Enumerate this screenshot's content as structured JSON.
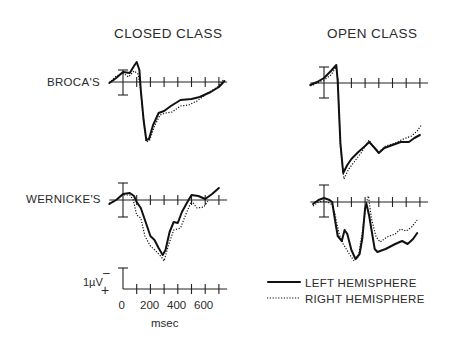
{
  "chart_data": {
    "type": "line",
    "title": "",
    "columns": [
      "CLOSED CLASS",
      "OPEN CLASS"
    ],
    "rows": [
      "BROCA'S",
      "WERNICKE'S"
    ],
    "xlabel": "msec",
    "x_ticks": [
      0,
      200,
      400,
      600
    ],
    "x_tick_interval_ms": 100,
    "xlim": [
      -100,
      750
    ],
    "scale_bar": {
      "label": "1µV",
      "minus_sign": "−",
      "plus_sign": "+",
      "value_uV": 1,
      "polarity": "negative up"
    },
    "legend": [
      {
        "name": "LEFT HEMISPHERE",
        "style": "solid"
      },
      {
        "name": "RIGHT HEMISPHERE",
        "style": "dotted"
      }
    ],
    "grid": false,
    "panels": [
      {
        "id": "broca-closed",
        "row": "BROCA'S",
        "column": "CLOSED CLASS",
        "x0": 123,
        "baseline": 82,
        "err_top": 70,
        "err_bot": 95,
        "series": [
          {
            "name": "LEFT HEMISPHERE",
            "points": [
              [
                -100,
                0.05
              ],
              [
                -50,
                -0.2
              ],
              [
                0,
                -0.5
              ],
              [
                50,
                -0.45
              ],
              [
                80,
                -0.8
              ],
              [
                100,
                -1.0
              ],
              [
                120,
                -0.6
              ],
              [
                130,
                0.4
              ],
              [
                150,
                1.9
              ],
              [
                170,
                2.9
              ],
              [
                190,
                2.85
              ],
              [
                220,
                2.15
              ],
              [
                260,
                1.55
              ],
              [
                300,
                1.45
              ],
              [
                350,
                1.2
              ],
              [
                420,
                0.9
              ],
              [
                500,
                0.85
              ],
              [
                560,
                0.75
              ],
              [
                640,
                0.5
              ],
              [
                700,
                0.25
              ],
              [
                740,
                -0.05
              ]
            ]
          },
          {
            "name": "RIGHT HEMISPHERE",
            "points": [
              [
                -100,
                0.05
              ],
              [
                -50,
                -0.3
              ],
              [
                0,
                -0.45
              ],
              [
                40,
                -0.25
              ],
              [
                80,
                -0.55
              ],
              [
                110,
                -0.4
              ],
              [
                125,
                0.2
              ],
              [
                145,
                1.6
              ],
              [
                170,
                3.0
              ],
              [
                195,
                2.9
              ],
              [
                230,
                2.2
              ],
              [
                270,
                1.65
              ],
              [
                310,
                1.55
              ],
              [
                360,
                1.5
              ],
              [
                420,
                1.2
              ],
              [
                480,
                1.15
              ],
              [
                540,
                0.95
              ],
              [
                620,
                0.55
              ],
              [
                690,
                0.25
              ],
              [
                730,
                -0.1
              ]
            ]
          }
        ]
      },
      {
        "id": "broca-open",
        "row": "BROCA'S",
        "column": "OPEN CLASS",
        "x0": 324,
        "baseline": 83,
        "err_top": 67,
        "err_bot": 98,
        "series": [
          {
            "name": "LEFT HEMISPHERE",
            "points": [
              [
                -100,
                0.1
              ],
              [
                -50,
                -0.05
              ],
              [
                0,
                -0.25
              ],
              [
                50,
                -0.6
              ],
              [
                90,
                -0.9
              ],
              [
                100,
                -0.1
              ],
              [
                120,
                3.0
              ],
              [
                140,
                4.5
              ],
              [
                170,
                4.1
              ],
              [
                200,
                3.8
              ],
              [
                250,
                3.45
              ],
              [
                300,
                3.15
              ],
              [
                330,
                2.95
              ],
              [
                370,
                3.25
              ],
              [
                400,
                3.5
              ],
              [
                440,
                3.25
              ],
              [
                500,
                3.1
              ],
              [
                560,
                2.95
              ],
              [
                620,
                2.95
              ],
              [
                660,
                2.75
              ],
              [
                700,
                2.6
              ]
            ]
          },
          {
            "name": "RIGHT HEMISPHERE",
            "points": [
              [
                -100,
                0.15
              ],
              [
                -50,
                0.0
              ],
              [
                0,
                -0.15
              ],
              [
                50,
                -0.4
              ],
              [
                90,
                -0.8
              ],
              [
                100,
                -0.2
              ],
              [
                120,
                3.2
              ],
              [
                145,
                4.8
              ],
              [
                180,
                4.3
              ],
              [
                220,
                3.95
              ],
              [
                270,
                3.5
              ],
              [
                330,
                2.85
              ],
              [
                360,
                3.2
              ],
              [
                400,
                3.45
              ],
              [
                450,
                3.15
              ],
              [
                520,
                3.0
              ],
              [
                580,
                2.8
              ],
              [
                640,
                2.65
              ],
              [
                680,
                2.4
              ],
              [
                710,
                2.1
              ]
            ]
          }
        ]
      },
      {
        "id": "wernicke-closed",
        "row": "WERNICKE'S",
        "column": "CLOSED CLASS",
        "x0": 123,
        "baseline": 200,
        "err_top": 183,
        "err_bot": 217,
        "series": [
          {
            "name": "LEFT HEMISPHERE",
            "points": [
              [
                -100,
                0.2
              ],
              [
                -50,
                0.0
              ],
              [
                0,
                -0.3
              ],
              [
                50,
                -0.35
              ],
              [
                80,
                -0.2
              ],
              [
                100,
                0.1
              ],
              [
                130,
                0.4
              ],
              [
                170,
                1.2
              ],
              [
                200,
                1.8
              ],
              [
                230,
                2.0
              ],
              [
                260,
                2.4
              ],
              [
                290,
                2.75
              ],
              [
                310,
                2.5
              ],
              [
                340,
                1.6
              ],
              [
                370,
                1.1
              ],
              [
                400,
                1.15
              ],
              [
                430,
                0.6
              ],
              [
                470,
                0.1
              ],
              [
                500,
                -0.25
              ],
              [
                550,
                -0.2
              ],
              [
                600,
                -0.05
              ],
              [
                650,
                -0.3
              ],
              [
                700,
                -0.6
              ]
            ]
          },
          {
            "name": "RIGHT HEMISPHERE",
            "points": [
              [
                -100,
                0.15
              ],
              [
                -50,
                0.0
              ],
              [
                0,
                -0.25
              ],
              [
                50,
                -0.25
              ],
              [
                75,
                0.0
              ],
              [
                100,
                0.75
              ],
              [
                130,
                0.9
              ],
              [
                160,
                1.8
              ],
              [
                200,
                2.3
              ],
              [
                240,
                2.55
              ],
              [
                280,
                2.85
              ],
              [
                300,
                3.05
              ],
              [
                330,
                2.3
              ],
              [
                370,
                1.5
              ],
              [
                420,
                1.4
              ],
              [
                460,
                0.7
              ],
              [
                500,
                0.05
              ],
              [
                540,
                0.4
              ],
              [
                590,
                0.35
              ],
              [
                620,
                0.05
              ]
            ]
          }
        ]
      },
      {
        "id": "wernicke-open",
        "row": "WERNICKE'S",
        "column": "OPEN CLASS",
        "x0": 324,
        "baseline": 202,
        "err_top": 185,
        "err_bot": 217,
        "series": [
          {
            "name": "LEFT HEMISPHERE",
            "points": [
              [
                -80,
                0.1
              ],
              [
                -40,
                -0.1
              ],
              [
                0,
                -0.2
              ],
              [
                40,
                -0.1
              ],
              [
                60,
                0.0
              ],
              [
                80,
                0.9
              ],
              [
                100,
                1.7
              ],
              [
                130,
                1.95
              ],
              [
                150,
                1.4
              ],
              [
                170,
                1.6
              ],
              [
                200,
                2.4
              ],
              [
                230,
                2.85
              ],
              [
                260,
                2.6
              ],
              [
                280,
                1.8
              ],
              [
                300,
                0.3
              ],
              [
                310,
                0.1
              ],
              [
                330,
                0.7
              ],
              [
                370,
                2.35
              ],
              [
                390,
                2.5
              ],
              [
                450,
                2.35
              ],
              [
                520,
                2.1
              ],
              [
                570,
                1.95
              ],
              [
                610,
                2.1
              ],
              [
                650,
                1.85
              ],
              [
                680,
                1.55
              ]
            ]
          },
          {
            "name": "RIGHT HEMISPHERE",
            "points": [
              [
                -80,
                0.2
              ],
              [
                -40,
                0.0
              ],
              [
                0,
                -0.05
              ],
              [
                40,
                0.05
              ],
              [
                60,
                0.15
              ],
              [
                80,
                0.6
              ],
              [
                110,
                1.6
              ],
              [
                140,
                2.1
              ],
              [
                180,
                2.55
              ],
              [
                220,
                2.95
              ],
              [
                250,
                2.75
              ],
              [
                280,
                1.5
              ],
              [
                310,
                0.0
              ],
              [
                325,
                -0.3
              ],
              [
                345,
                0.8
              ],
              [
                380,
                1.75
              ],
              [
                410,
                2.0
              ],
              [
                460,
                1.75
              ],
              [
                520,
                1.6
              ],
              [
                560,
                1.35
              ],
              [
                600,
                1.45
              ],
              [
                640,
                1.25
              ],
              [
                680,
                0.9
              ]
            ]
          }
        ]
      }
    ],
    "scale_axis": {
      "x0": 123,
      "baseline": 289,
      "bar_top": 268
    }
  },
  "labels": {
    "col_closed": "CLOSED CLASS",
    "col_open": "OPEN CLASS",
    "row_broca": "BROCA'S",
    "row_wernicke": "WERNICKE'S",
    "scale_uv": "1µV",
    "scale_minus": "–",
    "scale_plus": "+",
    "tick_0": "0",
    "tick_200": "200",
    "tick_400": "400",
    "tick_600": "600",
    "xlabel": "msec",
    "legend_left": "LEFT HEMISPHERE",
    "legend_right": "RIGHT HEMISPHERE"
  }
}
